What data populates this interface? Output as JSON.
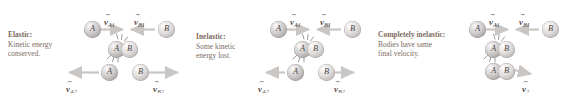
{
  "figure": {
    "background": "#ffffff",
    "text_color": "#7a6a5e",
    "arrow_color": "#c9c6c4",
    "ball_color": "#cfcccb"
  },
  "panels": [
    {
      "id": "elastic",
      "caption": {
        "title": "Elastic:",
        "line2": "Kinetic energy",
        "line3": "conserved."
      },
      "before": {
        "balls": [
          {
            "label": "A",
            "x": 84,
            "y": 21
          },
          {
            "label": "B",
            "x": 158,
            "y": 21
          }
        ],
        "vectors": [
          {
            "symbol": "v",
            "subscript": "A1",
            "direction": "right",
            "label_x": 104,
            "label_y": 12
          },
          {
            "symbol": "v",
            "subscript": "B1",
            "direction": "left",
            "label_x": 134,
            "label_y": 12
          }
        ]
      },
      "collision": {
        "balls": [
          {
            "label": "A",
            "x": 108,
            "y": 41
          },
          {
            "label": "B",
            "x": 121,
            "y": 41
          }
        ],
        "impact_marks": 2
      },
      "after": {
        "balls": [
          {
            "label": "A",
            "x": 101,
            "y": 64
          },
          {
            "label": "B",
            "x": 132,
            "y": 64
          }
        ],
        "vectors": [
          {
            "symbol": "v",
            "subscript": "A2",
            "direction": "left",
            "label_x": 66,
            "label_y": 79
          },
          {
            "symbol": "v",
            "subscript": "B2",
            "direction": "right",
            "label_x": 153,
            "label_y": 79
          }
        ]
      }
    },
    {
      "id": "inelastic",
      "caption": {
        "title": "Inelastic:",
        "line2": "Some kinetic",
        "line3": "energy lost."
      },
      "before": {
        "balls": [
          {
            "label": "A",
            "x": 84,
            "y": 21
          },
          {
            "label": "B",
            "x": 158,
            "y": 21
          }
        ],
        "vectors": [
          {
            "symbol": "v",
            "subscript": "A1",
            "direction": "right",
            "label_x": 104,
            "label_y": 12
          },
          {
            "symbol": "v",
            "subscript": "B1",
            "direction": "left",
            "label_x": 134,
            "label_y": 12
          }
        ]
      },
      "collision": {
        "balls": [
          {
            "label": "A",
            "x": 108,
            "y": 41
          },
          {
            "label": "B",
            "x": 121,
            "y": 41
          }
        ],
        "impact_marks": 2
      },
      "after": {
        "balls": [
          {
            "label": "A",
            "x": 101,
            "y": 64
          },
          {
            "label": "B",
            "x": 132,
            "y": 64
          }
        ],
        "vectors": [
          {
            "symbol": "v",
            "subscript": "A2",
            "direction": "left",
            "label_x": 72,
            "label_y": 79
          },
          {
            "symbol": "v",
            "subscript": "B2",
            "direction": "right",
            "label_x": 148,
            "label_y": 79
          }
        ]
      }
    },
    {
      "id": "completely-inelastic",
      "caption": {
        "title": "Completely inelastic:",
        "line2": "Bodies have same",
        "line3": "final velocity."
      },
      "before": {
        "balls": [
          {
            "label": "A",
            "x": 97,
            "y": 21
          },
          {
            "label": "B",
            "x": 170,
            "y": 21
          }
        ],
        "vectors": [
          {
            "symbol": "v",
            "subscript": "A1",
            "direction": "right",
            "label_x": 117,
            "label_y": 12
          },
          {
            "symbol": "v",
            "subscript": "B1",
            "direction": "left",
            "label_x": 147,
            "label_y": 12
          }
        ]
      },
      "collision": {
        "balls": [
          {
            "label": "A",
            "x": 113,
            "y": 41
          },
          {
            "label": "B",
            "x": 126,
            "y": 41
          }
        ],
        "impact_marks": 2
      },
      "after": {
        "balls": [
          {
            "label": "A",
            "x": 113,
            "y": 63
          },
          {
            "label": "B",
            "x": 126,
            "y": 63
          }
        ],
        "vectors": [
          {
            "symbol": "v",
            "subscript": "2",
            "direction": "right",
            "label_x": 150,
            "label_y": 79
          }
        ]
      }
    }
  ]
}
